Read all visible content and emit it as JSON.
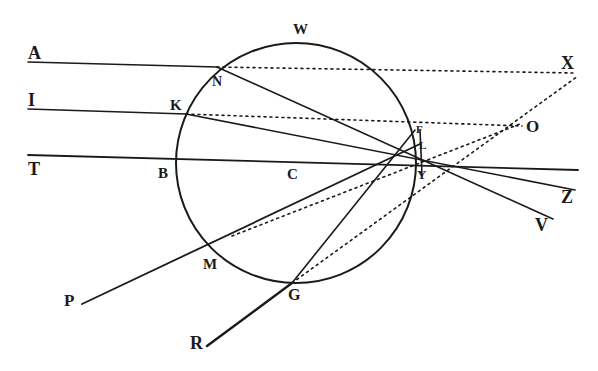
{
  "figure": {
    "ink_color": "#1a1a1a",
    "background": "#ffffff",
    "circle": {
      "center_label": "C",
      "cx": 294,
      "cy": 172,
      "r": 119
    },
    "labels": {
      "A": "A",
      "I": "I",
      "T": "T",
      "N": "N",
      "K": "K",
      "B": "B",
      "C": "C",
      "W": "W",
      "F": "F",
      "L": "L",
      "Y": "Y",
      "X": "X",
      "O": "O",
      "Z": "Z",
      "V": "V",
      "M": "M",
      "G": "G",
      "P": "P",
      "R": "R"
    },
    "solid_rays": [
      {
        "name": "ray-A-N",
        "from": "A",
        "to": "N"
      },
      {
        "name": "ray-N-F-V",
        "from": "N",
        "to": "V"
      },
      {
        "name": "ray-I-K",
        "from": "I",
        "to": "K"
      },
      {
        "name": "ray-K-L-Z",
        "from": "K",
        "to": "Z"
      },
      {
        "name": "axis-T-B-C",
        "from": "T",
        "to": "end"
      },
      {
        "name": "ray-P-M-L",
        "from": "P",
        "to": "L"
      },
      {
        "name": "ray-R-G-F",
        "from": "R",
        "to": "F"
      }
    ],
    "dotted_rays": [
      {
        "name": "dotted-N-X",
        "from": "N",
        "to": "X"
      },
      {
        "name": "dotted-K-O",
        "from": "K",
        "to": "O"
      },
      {
        "name": "dotted-G-X",
        "from": "G",
        "to": "X"
      },
      {
        "name": "dotted-M-O",
        "from": "M",
        "to": "O"
      }
    ]
  }
}
